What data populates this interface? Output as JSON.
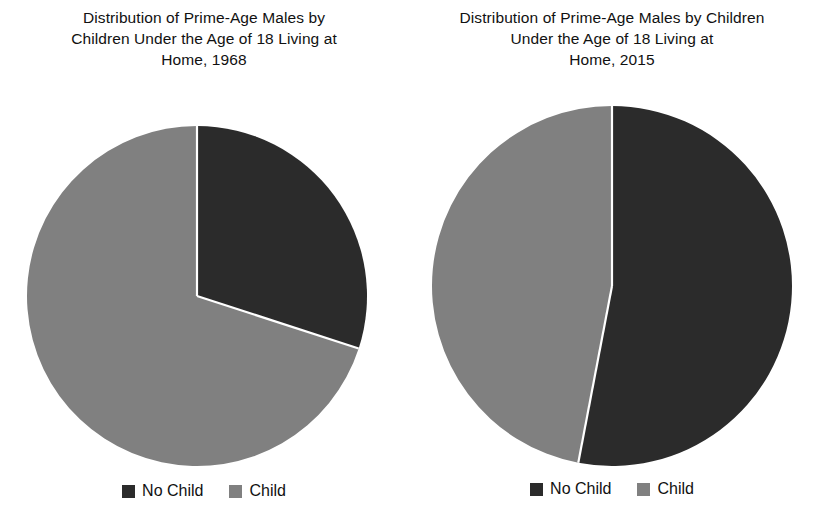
{
  "figure": {
    "background_color": "#ffffff",
    "text_color": "#111111"
  },
  "colors": {
    "no_child": "#2b2b2b",
    "child": "#808080",
    "separator": "#ffffff"
  },
  "panels": [
    {
      "id": "panel-1968",
      "title": "Distribution of Prime-Age Males by\nChildren Under the Age of 18 Living at\nHome, 1968",
      "legend": [
        {
          "label": "No Child",
          "color": "#2b2b2b"
        },
        {
          "label": "Child",
          "color": "#808080"
        }
      ]
    },
    {
      "id": "panel-2015",
      "title": "Distribution of Prime-Age Males by Children\nUnder the Age of 18 Living at\nHome, 2015",
      "legend": [
        {
          "label": "No Child",
          "color": "#2b2b2b"
        },
        {
          "label": "Child",
          "color": "#808080"
        }
      ]
    }
  ],
  "chart_data": [
    {
      "type": "pie",
      "title": "Distribution of Prime-Age Males by Children Under the Age of 18 Living at Home, 1968",
      "labels": [
        "No Child",
        "Child"
      ],
      "values": [
        30,
        70
      ],
      "unit": "percent",
      "start_angle_deg": 0,
      "direction": "clockwise",
      "colors": [
        "#2b2b2b",
        "#808080"
      ],
      "legend_position": "bottom",
      "radius_px": 170,
      "center_px": [
        196,
        295
      ]
    },
    {
      "type": "pie",
      "title": "Distribution of Prime-Age Males by Children Under the Age of 18 Living at Home, 2015",
      "labels": [
        "No Child",
        "Child"
      ],
      "values": [
        53,
        47
      ],
      "unit": "percent",
      "start_angle_deg": 0,
      "direction": "clockwise",
      "colors": [
        "#2b2b2b",
        "#808080"
      ],
      "legend_position": "bottom",
      "radius_px": 180,
      "center_px": [
        611,
        285
      ]
    }
  ]
}
